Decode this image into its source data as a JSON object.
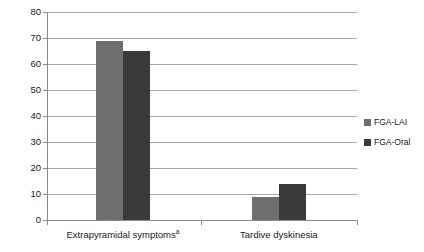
{
  "chart_data": {
    "type": "bar",
    "title": "",
    "subtitle": "",
    "xlabel": "",
    "ylabel": "Prevalence (%)",
    "categories": [
      "Extrapyramidal symptoms",
      "Tardive dyskinesia"
    ],
    "category_footnotes": [
      "a",
      ""
    ],
    "series": [
      {
        "name": "FGA-LAI",
        "color": "#6e6e6e",
        "values": [
          69,
          9
        ]
      },
      {
        "name": "FGA-Oral",
        "color": "#3a3a3a",
        "values": [
          65,
          14
        ]
      }
    ],
    "ylim": [
      0,
      80
    ],
    "ytick_step": 10,
    "yticks": [
      0,
      10,
      20,
      30,
      40,
      50,
      60,
      70,
      80
    ],
    "ytick_labels": [
      "0",
      "10",
      "20",
      "30",
      "40",
      "50",
      "60",
      "70",
      "80"
    ],
    "grid": true,
    "grid_axis": "y",
    "legend_position": "right"
  },
  "axis": {
    "y_title": "Prevalence (%)"
  },
  "colors": {
    "fga_lai": "#6e6e6e",
    "fga_oral": "#3a3a3a",
    "gridline": "#a8a8a8",
    "axis": "#8a8a8a",
    "background": "#ffffff"
  }
}
